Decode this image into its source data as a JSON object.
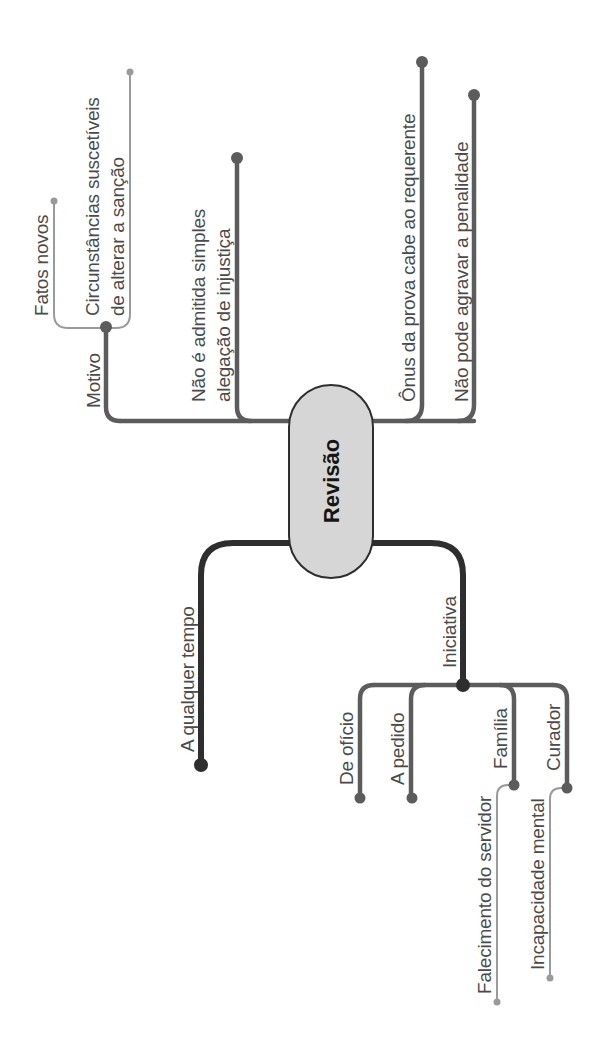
{
  "diagram": {
    "type": "mind-map",
    "orientation": "rotated-90-ccw",
    "colors": {
      "background": "#ffffff",
      "center_fill": "#d6d6d6",
      "center_stroke": "#2e2e2e",
      "branch_dark": "#2e2e2e",
      "branch_medium": "#5c5c5c",
      "branch_light": "#9a9a9a",
      "text": "#4a4a4a"
    },
    "center": {
      "label": "Revisão"
    },
    "branches": [
      {
        "label": "Motivo",
        "children": [
          {
            "label": "Fatos novos"
          },
          {
            "label_lines": [
              "Circunstâncias suscetíveis",
              "de alterar a sanção"
            ]
          }
        ]
      },
      {
        "label_lines": [
          "Não é admitida simples",
          "alegação de injustiça"
        ]
      },
      {
        "label": "Ônus da prova cabe ao requerente"
      },
      {
        "label": "Não pode agravar a penalidade"
      },
      {
        "label": "A qualquer tempo"
      },
      {
        "label": "Iniciativa",
        "children": [
          {
            "label": "De ofício"
          },
          {
            "label": "A pedido"
          },
          {
            "label": "Família",
            "children": [
              {
                "label": "Falecimento do servidor"
              }
            ]
          },
          {
            "label": "Curador",
            "children": [
              {
                "label": "Incapacidade mental"
              }
            ]
          }
        ]
      }
    ]
  }
}
